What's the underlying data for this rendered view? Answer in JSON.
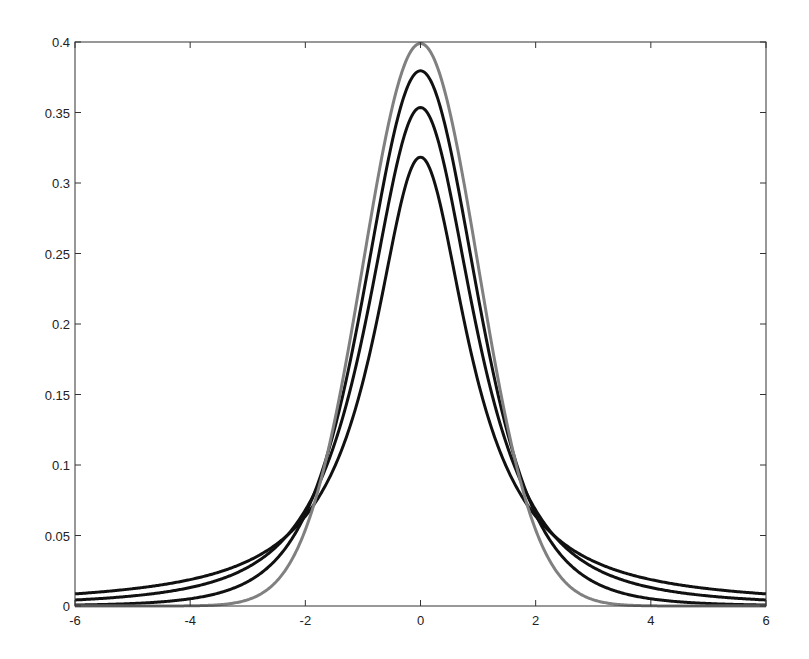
{
  "chart_data": {
    "type": "line",
    "title": "",
    "xlabel": "",
    "ylabel": "",
    "xlim": [
      -6,
      6
    ],
    "ylim": [
      0,
      0.4
    ],
    "grid": false,
    "legend": null,
    "x_ticks": [
      "-6",
      "-4",
      "-2",
      "0",
      "2",
      "4",
      "6"
    ],
    "y_ticks": [
      "0",
      "0.05",
      "0.1",
      "0.15",
      "0.2",
      "0.25",
      "0.3",
      "0.35",
      "0.4"
    ],
    "series": [
      {
        "name": "Normal N(0,1)",
        "color": "#808080",
        "kind": "normal",
        "peak": 0.399
      },
      {
        "name": "Student t (nu=5)",
        "color": "#111111",
        "kind": "t",
        "nu": 5,
        "peak": 0.38
      },
      {
        "name": "Student t (nu=2)",
        "color": "#111111",
        "kind": "t",
        "nu": 2,
        "peak": 0.354
      },
      {
        "name": "Student t (nu=1)",
        "color": "#111111",
        "kind": "t",
        "nu": 1,
        "peak": 0.318
      }
    ],
    "sample_points": {
      "x": [
        -6,
        -4,
        -2,
        0,
        2,
        4,
        6
      ],
      "Normal N(0,1)": [
        0.0,
        0.0001,
        0.054,
        0.399,
        0.054,
        0.0001,
        0.0
      ],
      "Student t (nu=5)": [
        0.0018,
        0.0051,
        0.0651,
        0.3796,
        0.0651,
        0.0051,
        0.0018
      ],
      "Student t (nu=2)": [
        0.0044,
        0.0131,
        0.068,
        0.3536,
        0.068,
        0.0131,
        0.0044
      ],
      "Student t (nu=1)": [
        0.0086,
        0.0187,
        0.0637,
        0.3183,
        0.0637,
        0.0187,
        0.0086
      ]
    }
  }
}
